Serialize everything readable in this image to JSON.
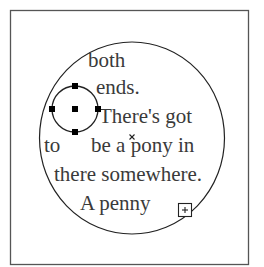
{
  "document": {
    "shape_text": {
      "lines": [
        {
          "text": "both",
          "x": 88,
          "y": 67
        },
        {
          "text": "ends.",
          "x": 96,
          "y": 94
        },
        {
          "text": "There's got",
          "x": 99,
          "y": 123
        },
        {
          "text": "to",
          "x": 44,
          "y": 152
        },
        {
          "text": "be a pony in",
          "x": 91,
          "y": 152
        },
        {
          "text": "there somewhere.",
          "x": 54,
          "y": 181
        },
        {
          "text": "A penny",
          "x": 80,
          "y": 210
        }
      ]
    },
    "icons": {
      "overflow_indicator": "plus-in-square",
      "center_marker": "x-mark",
      "selection_handles": "square-handles"
    },
    "colors": {
      "frame": "#555555",
      "shape_stroke": "#222222",
      "text": "#3a3a3a",
      "handle": "#000000"
    }
  }
}
